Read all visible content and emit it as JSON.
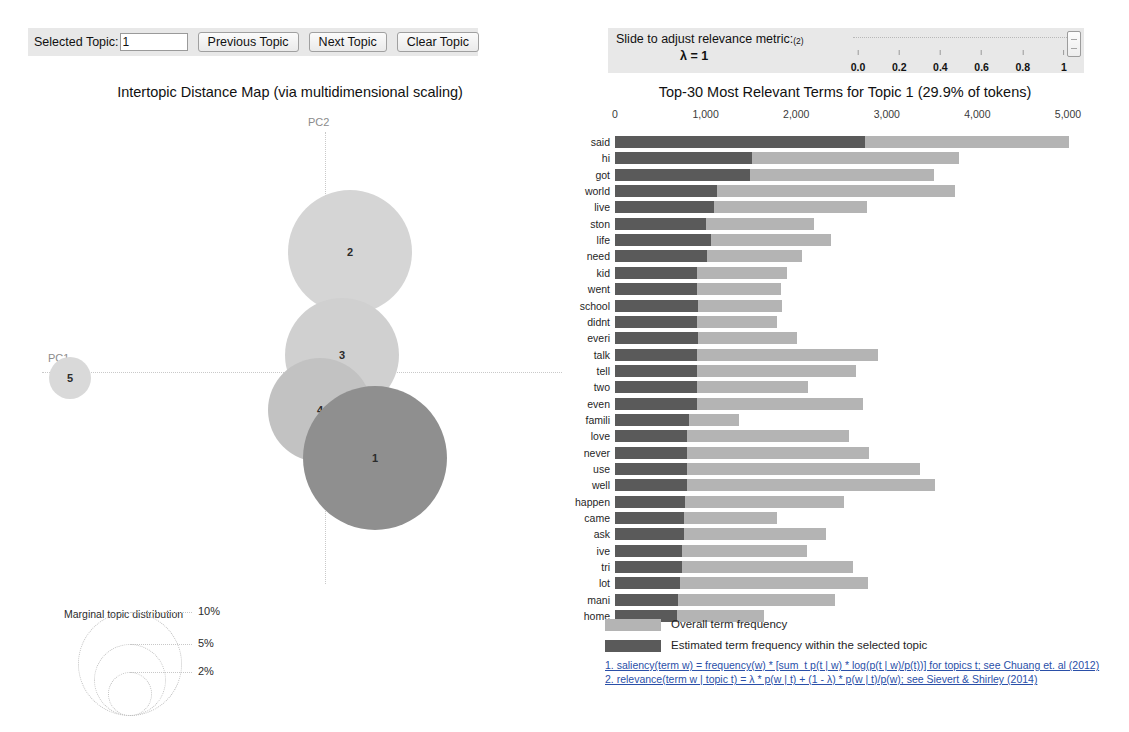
{
  "topic_control": {
    "label": "Selected Topic:",
    "value": "1",
    "previous_label": "Previous Topic",
    "next_label": "Next Topic",
    "clear_label": "Clear Topic"
  },
  "lambda_control": {
    "title": "Slide to adjust relevance metric:",
    "title_sup": "(2)",
    "value_text": "λ = 1",
    "lambda": 1,
    "ticks": [
      {
        "label": "0.0",
        "value": 0.0
      },
      {
        "label": "0.2",
        "value": 0.2
      },
      {
        "label": "0.4",
        "value": 0.4
      },
      {
        "label": "0.6",
        "value": 0.6
      },
      {
        "label": "0.8",
        "value": 0.8
      },
      {
        "label": "1",
        "value": 1.0
      }
    ]
  },
  "intertopic_map": {
    "title": "Intertopic Distance Map (via multidimensional scaling)",
    "x_axis_label": "PC1",
    "y_axis_label": "PC2",
    "topics": [
      {
        "id": "2",
        "cx": 330,
        "cy": 142,
        "r": 62,
        "fill": "#d5d5d5"
      },
      {
        "id": "3",
        "cx": 322,
        "cy": 245,
        "r": 57,
        "fill": "#d0d0d0"
      },
      {
        "id": "4",
        "cx": 300,
        "cy": 300,
        "r": 52,
        "fill": "#c2c2c2"
      },
      {
        "id": "1",
        "cx": 355,
        "cy": 348,
        "r": 72,
        "fill": "#8f8f8f"
      },
      {
        "id": "5",
        "cx": 50,
        "cy": 268,
        "r": 21,
        "fill": "#d9d9d9"
      }
    ],
    "marginal_legend": {
      "title": "Marginal topic distribution",
      "items": [
        {
          "label": "2%",
          "r": 22
        },
        {
          "label": "5%",
          "r": 36
        },
        {
          "label": "10%",
          "r": 52
        }
      ]
    }
  },
  "chart_data": {
    "type": "bar",
    "title": "Top-30 Most Relevant Terms for Topic 1 (29.9% of tokens)",
    "orientation": "horizontal",
    "stacked": true,
    "xlabel": "",
    "ylabel": "",
    "xlim": [
      0,
      5000
    ],
    "xticks": [
      0,
      1000,
      2000,
      3000,
      4000,
      5000
    ],
    "xtick_labels": [
      "0",
      "1,000",
      "2,000",
      "3,000",
      "4,000",
      "5,000"
    ],
    "grid": false,
    "legend_position": "bottom-left",
    "categories": [
      "said",
      "hi",
      "got",
      "world",
      "live",
      "ston",
      "life",
      "need",
      "kid",
      "went",
      "school",
      "didnt",
      "everi",
      "talk",
      "tell",
      "two",
      "even",
      "famili",
      "love",
      "never",
      "use",
      "well",
      "happen",
      "came",
      "ask",
      "ive",
      "tri",
      "lot",
      "mani",
      "home"
    ],
    "series": [
      {
        "name": "Overall term frequency",
        "color": "#b4b4b4",
        "values": [
          5010,
          3800,
          3520,
          3750,
          2780,
          2200,
          2380,
          2060,
          1900,
          1830,
          1840,
          1790,
          2010,
          2900,
          2660,
          2130,
          2740,
          1370,
          2580,
          2800,
          3370,
          3530,
          2530,
          1790,
          2330,
          2120,
          2630,
          2790,
          2430,
          1640
        ]
      },
      {
        "name": "Estimated term frequency within the selected topic",
        "color": "#5a5a5a",
        "values": [
          2760,
          1510,
          1490,
          1130,
          1090,
          1000,
          1060,
          1020,
          900,
          900,
          920,
          900,
          920,
          900,
          900,
          900,
          900,
          820,
          790,
          790,
          790,
          790,
          770,
          760,
          760,
          740,
          740,
          720,
          700,
          680
        ]
      }
    ]
  },
  "bar_legend": [
    {
      "name": "Overall term frequency",
      "color": "#b4b4b4"
    },
    {
      "name": "Estimated term frequency within the selected topic",
      "color": "#5a5a5a"
    }
  ],
  "footnotes": [
    "1. saliency(term w) = frequency(w) * [sum_t p(t | w) * log(p(t | w)/p(t))] for topics t; see Chuang et. al (2012)",
    "2. relevance(term w | topic t) = λ * p(w | t) + (1 - λ) * p(w | t)/p(w); see Sievert & Shirley (2014)"
  ]
}
